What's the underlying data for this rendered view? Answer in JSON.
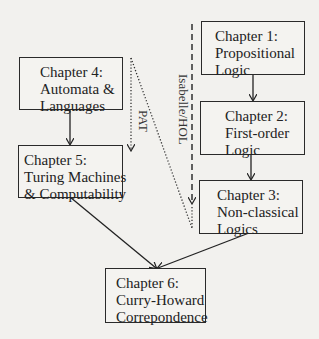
{
  "diagram": {
    "nodes": [
      {
        "id": "ch1",
        "lines": [
          "Chapter 1:",
          "Propositional",
          "Logic"
        ]
      },
      {
        "id": "ch2",
        "lines": [
          "Chapter 2:",
          "First-order",
          "Logic"
        ]
      },
      {
        "id": "ch3",
        "lines": [
          "Chapter 3:",
          "Non-classical",
          "Logics"
        ]
      },
      {
        "id": "ch4",
        "lines": [
          "Chapter 4:",
          "Automata &",
          "Languages"
        ]
      },
      {
        "id": "ch5",
        "lines": [
          "Chapter 5:",
          "Turing Machines",
          "& Computability"
        ]
      },
      {
        "id": "ch6",
        "lines": [
          "Chapter 6:",
          "Curry-Howard",
          "Correpondence"
        ]
      }
    ],
    "edge_labels": {
      "pat": "PAT",
      "isabelle": "Isabelle/HOL"
    },
    "edges": [
      {
        "from": "ch1",
        "to": "ch2",
        "style": "solid"
      },
      {
        "from": "ch2",
        "to": "ch3",
        "style": "solid"
      },
      {
        "from": "ch4",
        "to": "ch5",
        "style": "solid"
      },
      {
        "from": "ch5",
        "to": "ch6",
        "style": "solid"
      },
      {
        "from": "ch3",
        "to": "ch6",
        "style": "solid"
      },
      {
        "label": "PAT",
        "style": "dotted"
      },
      {
        "label": "Isabelle/HOL",
        "style": "dashed"
      }
    ]
  }
}
